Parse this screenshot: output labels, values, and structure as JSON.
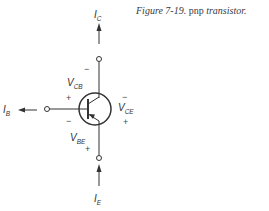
{
  "figure": {
    "caption_prefix": "Figure 7-19.",
    "caption_main": "pnp",
    "caption_suffix": "transistor."
  },
  "labels": {
    "ic": {
      "main": "I",
      "sub": "C"
    },
    "ib": {
      "main": "I",
      "sub": "B"
    },
    "ie": {
      "main": "I",
      "sub": "E"
    },
    "vcb": {
      "main": "V",
      "sub": "CB"
    },
    "vbe": {
      "main": "V",
      "sub": "BE"
    },
    "vce": {
      "main": "V",
      "sub": "CE"
    }
  },
  "signs": {
    "vcb_top": "−",
    "vcb_bottom": "+",
    "vbe_top": "−",
    "vbe_bottom": "+",
    "vce_top": "−",
    "vce_bottom": "+"
  },
  "colors": {
    "line": "#333333",
    "text": "#333333"
  }
}
